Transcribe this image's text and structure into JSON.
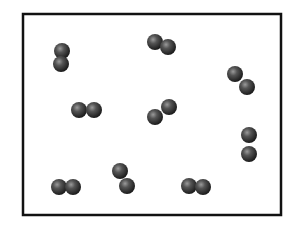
{
  "diagram": {
    "box": {
      "x": 23,
      "y": 14,
      "width": 258,
      "height": 201,
      "stroke": "#111111",
      "stroke_width": 2.5
    },
    "atom": {
      "radius": 8,
      "fill_dark": "#1e1e1e",
      "fill_mid": "#555555",
      "highlight": "#9a9a9a"
    },
    "molecules": [
      {
        "id": 1,
        "atoms": [
          [
            62,
            51
          ],
          [
            61,
            64
          ]
        ]
      },
      {
        "id": 2,
        "atoms": [
          [
            155,
            42
          ],
          [
            168,
            47
          ]
        ]
      },
      {
        "id": 3,
        "atoms": [
          [
            235,
            74
          ],
          [
            247,
            87
          ]
        ]
      },
      {
        "id": 4,
        "atoms": [
          [
            79,
            110
          ],
          [
            94,
            110
          ]
        ]
      },
      {
        "id": 5,
        "atoms": [
          [
            155,
            117
          ],
          [
            169,
            107
          ]
        ]
      },
      {
        "id": 6,
        "atoms": [
          [
            249,
            135
          ],
          [
            249,
            154
          ]
        ]
      },
      {
        "id": 7,
        "atoms": [
          [
            59,
            187
          ],
          [
            73,
            187
          ]
        ]
      },
      {
        "id": 8,
        "atoms": [
          [
            120,
            171
          ],
          [
            127,
            186
          ]
        ]
      },
      {
        "id": 9,
        "atoms": [
          [
            189,
            186
          ],
          [
            203,
            187
          ]
        ]
      }
    ]
  }
}
